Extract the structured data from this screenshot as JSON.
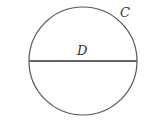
{
  "diagram": {
    "shape": "circle",
    "circle_label": "C",
    "diameter_label": "D",
    "stroke_color": "#555555"
  }
}
